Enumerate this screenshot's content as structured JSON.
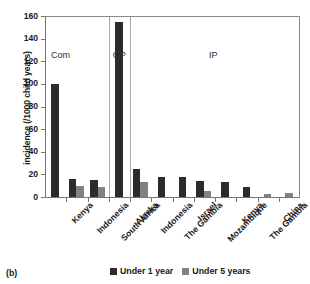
{
  "panel_label": "(b)",
  "legend": {
    "position": "bottom-center",
    "items": [
      {
        "label": "Under 1 year",
        "color": "#2b2b2b"
      },
      {
        "label": "Under 5 years",
        "color": "#828282"
      }
    ]
  },
  "group_labels": [
    {
      "text": "Com",
      "value": 130
    },
    {
      "text": "OP",
      "value": 130
    },
    {
      "text": "IP",
      "value": 130
    }
  ],
  "chart_data": {
    "type": "bar",
    "title": "",
    "subtitle": "",
    "xlabel": "",
    "ylabel": "incidence (/1000 child years)",
    "ylim": [
      0,
      160
    ],
    "yticks": [
      0,
      20,
      40,
      60,
      80,
      100,
      120,
      140,
      160
    ],
    "grid": false,
    "categories": [
      "Kenya",
      "Indonesia",
      "South Africa",
      "Alaska",
      "Indonesia",
      "The Gambia",
      "Israel",
      "Mozambique",
      "Kenya",
      "The Gambia",
      "China",
      "South Africa"
    ],
    "groups": [
      {
        "label": "Com",
        "categories": [
          "Kenya",
          "Indonesia",
          "South Africa"
        ]
      },
      {
        "label": "OP",
        "categories": [
          "Alaska"
        ]
      },
      {
        "label": "IP",
        "categories": [
          "Indonesia",
          "The Gambia",
          "Israel",
          "Mozambique",
          "Kenya",
          "The Gambia",
          "China",
          "South Africa"
        ]
      }
    ],
    "series": [
      {
        "name": "Under 1 year",
        "color": "#2b2b2b",
        "values": [
          100,
          16,
          15,
          155,
          25,
          17.5,
          17.5,
          14,
          13,
          9,
          null,
          null
        ]
      },
      {
        "name": "Under 5 years",
        "color": "#828282",
        "values": [
          null,
          10,
          9,
          null,
          13.5,
          null,
          null,
          5,
          null,
          null,
          2.5,
          3.5
        ]
      }
    ]
  }
}
